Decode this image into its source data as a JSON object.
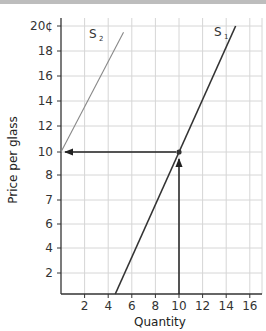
{
  "chart_data": {
    "type": "line",
    "title": "",
    "xlabel": "Quantity",
    "ylabel": "Price per glass",
    "xlim": [
      0,
      17
    ],
    "ylim": [
      0,
      20
    ],
    "x_ticks": [
      2,
      4,
      6,
      8,
      10,
      12,
      14,
      16
    ],
    "y_ticks": [
      {
        "value": 2,
        "label": "2"
      },
      {
        "value": 4,
        "label": "4"
      },
      {
        "value": 6,
        "label": "6"
      },
      {
        "value": 7,
        "label": "7"
      },
      {
        "value": 8,
        "label": "8"
      },
      {
        "value": 10,
        "label": "10"
      },
      {
        "value": 12,
        "label": "12"
      },
      {
        "value": 14,
        "label": "14"
      },
      {
        "value": 16,
        "label": "16"
      },
      {
        "value": 18,
        "label": "18"
      },
      {
        "value": 20,
        "label": "20¢"
      }
    ],
    "grid": true,
    "series": [
      {
        "name": "S1",
        "label": "S",
        "subscript": "1",
        "points": [
          [
            4.6,
            0
          ],
          [
            14.8,
            20
          ]
        ],
        "color": "#333333"
      },
      {
        "name": "S2",
        "label": "S",
        "subscript": "2",
        "points": [
          [
            0,
            10
          ],
          [
            5.3,
            19.5
          ]
        ],
        "color": "#888888"
      }
    ],
    "annotations": [
      {
        "type": "point",
        "x": 10,
        "y": 10,
        "description": "intersection of S1 with price 10 at quantity 10"
      },
      {
        "type": "arrow",
        "from": [
          10,
          0
        ],
        "to": [
          10,
          10
        ],
        "description": "vertical arrow from quantity 10 up to S1"
      },
      {
        "type": "arrow",
        "from": [
          10,
          10
        ],
        "to": [
          0,
          10
        ],
        "description": "horizontal arrow from S1 leftward to price axis at 10"
      }
    ]
  }
}
